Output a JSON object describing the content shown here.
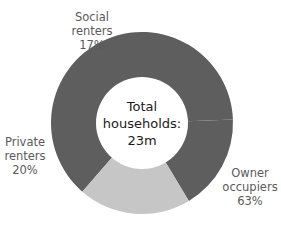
{
  "chart_data": {
    "type": "pie",
    "variant": "donut",
    "title": "",
    "center_label": [
      "Total",
      "households:",
      "23m"
    ],
    "categories": [
      "Owner occupiers",
      "Social renters",
      "Private renters"
    ],
    "values": [
      63,
      17,
      20
    ],
    "unit": "%",
    "colors": [
      "#5e5e5e",
      "#5e5e5e",
      "#c6c6c6"
    ],
    "legend": "none (direct labels)"
  },
  "labels": {
    "social": {
      "line1": "Social",
      "line2": "renters",
      "pct": "17%"
    },
    "private": {
      "line1": "Private",
      "line2": "renters",
      "pct": "20%"
    },
    "owner": {
      "line1": "Owner",
      "line2": "occupiers",
      "pct": "63%"
    },
    "center": {
      "line1": "Total",
      "line2": "households:",
      "line3": "23m"
    }
  }
}
